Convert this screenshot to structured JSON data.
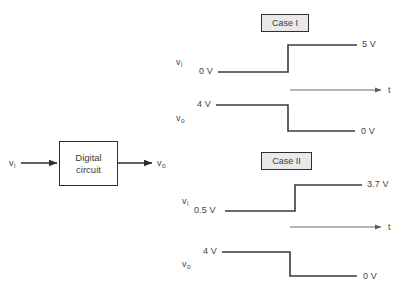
{
  "figure": {
    "title_fragment": "",
    "block": {
      "line1": "Digital",
      "line2": "circuit",
      "input_label": "v",
      "input_sub": "i",
      "output_label": "v",
      "output_sub": "o"
    },
    "cases": [
      {
        "name": "Case I",
        "input_trace": {
          "signal_label": "v",
          "signal_sub": "i",
          "low_label": "0 V",
          "high_label": "5 V",
          "low_value": 0,
          "high_value": 5
        },
        "time_axis_label": "t",
        "output_trace": {
          "signal_label": "v",
          "signal_sub": "o",
          "high_label": "4 V",
          "low_label": "0 V",
          "high_value": 4,
          "low_value": 0
        }
      },
      {
        "name": "Case II",
        "input_trace": {
          "signal_label": "v",
          "signal_sub": "i",
          "low_label": "0.5 V",
          "high_label": "3.7 V",
          "low_value": 0.5,
          "high_value": 3.7
        },
        "time_axis_label": "t",
        "output_trace": {
          "signal_label": "v",
          "signal_sub": "o",
          "high_label": "4 V",
          "low_label": "0 V",
          "high_value": 4,
          "low_value": 0
        }
      }
    ],
    "colors": {
      "trace": "#3a3a3a",
      "axis": "#6a6a6a",
      "box_border": "#2e2e2e",
      "case_fill": "#e9e9e9",
      "text": "#3f3f3f",
      "background": "#ffffff"
    }
  }
}
